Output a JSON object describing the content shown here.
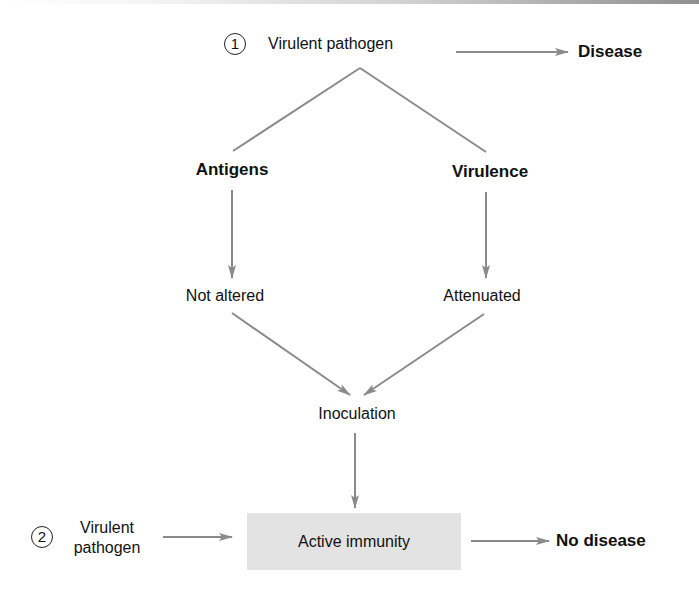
{
  "diagram": {
    "colors": {
      "line": "#8a8a8a",
      "box_fill": "#e3e3e3",
      "text": "#111111"
    },
    "nodes": {
      "pathogen1_number": "1",
      "pathogen1": "Virulent pathogen",
      "disease": "Disease",
      "antigens": "Antigens",
      "virulence": "Virulence",
      "not_altered": "Not altered",
      "attenuated": "Attenuated",
      "inoculation": "Inoculation",
      "pathogen2_number": "2",
      "pathogen2_line1": "Virulent",
      "pathogen2_line2": "pathogen",
      "active_immunity": "Active immunity",
      "no_disease": "No disease"
    },
    "edges": [
      {
        "from": "pathogen1",
        "to": "disease",
        "type": "arrow"
      },
      {
        "from": "pathogen1",
        "to": "antigens",
        "type": "line"
      },
      {
        "from": "pathogen1",
        "to": "virulence",
        "type": "line"
      },
      {
        "from": "antigens",
        "to": "not_altered",
        "type": "arrow"
      },
      {
        "from": "virulence",
        "to": "attenuated",
        "type": "arrow"
      },
      {
        "from": "not_altered",
        "to": "inoculation",
        "type": "arrow"
      },
      {
        "from": "attenuated",
        "to": "inoculation",
        "type": "arrow"
      },
      {
        "from": "inoculation",
        "to": "active_immunity",
        "type": "arrow"
      },
      {
        "from": "pathogen2",
        "to": "active_immunity",
        "type": "arrow"
      },
      {
        "from": "active_immunity",
        "to": "no_disease",
        "type": "arrow"
      }
    ]
  }
}
